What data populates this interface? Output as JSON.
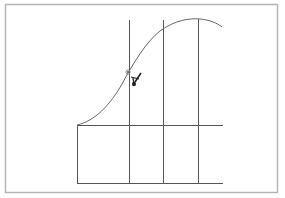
{
  "diagram": {
    "frame": {
      "x": 5,
      "y": 4,
      "width": 272,
      "height": 188,
      "stroke": "#b5b5b5"
    },
    "grid": {
      "stroke": "#555555",
      "left_x": 77,
      "right_x": 223,
      "top_y": 125,
      "bottom_y": 183,
      "vertical_lines_x": [
        129,
        163,
        198
      ],
      "vertical_lines_top_y": 20
    },
    "curve": {
      "stroke": "#666666",
      "points": [
        [
          77,
          125
        ],
        [
          100,
          110
        ],
        [
          128,
          72
        ],
        [
          150,
          38
        ],
        [
          175,
          24
        ],
        [
          197,
          19
        ],
        [
          222,
          27
        ]
      ]
    },
    "cursor": {
      "icon": "pen-cursor-icon",
      "x": 134,
      "y": 79,
      "marker_x": 128,
      "marker_y": 72,
      "color": "#222222"
    }
  }
}
